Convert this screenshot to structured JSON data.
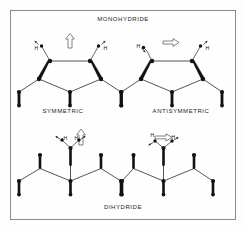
{
  "figure": {
    "title_top": "MONOHYDRIDE",
    "title_bottom": "DIHYDRIDE",
    "label_left": "SYMMETRIC",
    "label_right": "ANTISYMMETRIC",
    "hydrogen_symbol": "H",
    "colors": {
      "frame_border": "#8a8a8a",
      "background": "#fefefe",
      "atom": "#111111",
      "bond": "#2a2a2a",
      "mode_arrow": "#666666"
    }
  },
  "diagram_data": {
    "type": "diagram",
    "subject": "surface hydride vibrational modes",
    "panels": [
      {
        "id": "monohydride-symmetric",
        "group": "MONOHYDRIDE",
        "label": "SYMMETRIC",
        "position": "top-left",
        "ring": "pentagon",
        "hydrogen_count": 2,
        "hydrogen_labels": [
          "H",
          "H"
        ],
        "mode_arrow": "up",
        "mode_arrow_glyph": "arrow-up-outline-icon",
        "h_displacement": [
          "up-out",
          "up-out"
        ]
      },
      {
        "id": "monohydride-antisymmetric",
        "group": "MONOHYDRIDE",
        "label": "ANTISYMMETRIC",
        "position": "top-right",
        "ring": "pentagon",
        "hydrogen_count": 2,
        "hydrogen_labels": [
          "H",
          "H"
        ],
        "mode_arrow": "right",
        "mode_arrow_glyph": "arrow-right-outline-icon",
        "h_displacement": [
          "down-in",
          "up-out"
        ]
      },
      {
        "id": "dihydride-symmetric",
        "group": "DIHYDRIDE",
        "label": "",
        "position": "bottom-left",
        "ring": "zigzag-chain",
        "hydrogen_count": 2,
        "hydrogen_labels": [
          "H",
          "H"
        ],
        "mode_arrow": "up",
        "mode_arrow_glyph": "arrow-up-outline-icon",
        "h_displacement": [
          "up-left",
          "up-right"
        ]
      },
      {
        "id": "dihydride-antisymmetric",
        "group": "DIHYDRIDE",
        "label": "",
        "position": "bottom-right",
        "ring": "zigzag-chain",
        "hydrogen_count": 2,
        "hydrogen_labels": [
          "H",
          "H"
        ],
        "mode_arrow": "right",
        "mode_arrow_glyph": "arrow-right-outline-icon",
        "h_displacement": [
          "down-left",
          "up-right"
        ]
      }
    ]
  }
}
